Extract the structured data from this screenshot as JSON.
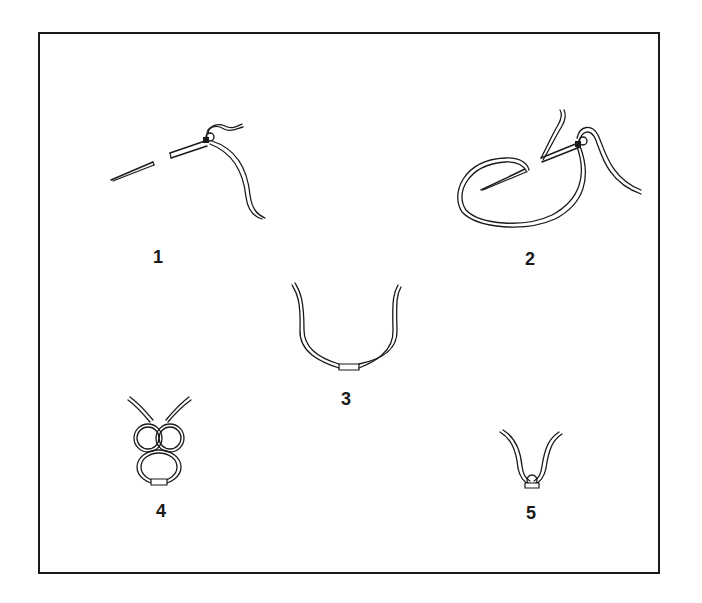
{
  "figure": {
    "steps": [
      {
        "id": 1,
        "label": "1",
        "content": "needle with thread passed through the eye"
      },
      {
        "id": 2,
        "label": "2",
        "content": "needle with thread looped around"
      },
      {
        "id": 3,
        "label": "3",
        "content": "U-shaped thread with joined ends"
      },
      {
        "id": 4,
        "label": "4",
        "content": "thread tied in double loop knot"
      },
      {
        "id": 5,
        "label": "5",
        "content": "V-shaped thread with tight knot"
      }
    ],
    "colors": {
      "line": "#1a1a1a",
      "background": "#ffffff"
    }
  }
}
